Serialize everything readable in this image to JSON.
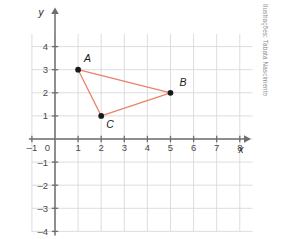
{
  "figure": {
    "credit": "Ilustrações: Tabata Nascimento",
    "axis_labels": {
      "x": "x",
      "y": "y"
    },
    "origin_label": "0"
  },
  "chart_data": {
    "type": "scatter",
    "title": "",
    "xlabel": "x",
    "ylabel": "y",
    "xlim": [
      -1.3,
      8.6
    ],
    "ylim": [
      -4.3,
      4.7
    ],
    "grid": true,
    "legend": "none",
    "xticks": [
      -1,
      0,
      1,
      2,
      3,
      4,
      5,
      6,
      7,
      8
    ],
    "xticklabels": [
      "–1",
      "0",
      "1",
      "2",
      "3",
      "4",
      "5",
      "6",
      "7",
      "8"
    ],
    "yticks": [
      -4,
      -3,
      -2,
      -1,
      1,
      2,
      3,
      4
    ],
    "yticklabels": [
      "–4",
      "–3",
      "–2",
      "–1",
      "1",
      "2",
      "3",
      "4"
    ],
    "points": [
      {
        "label": "A",
        "x": 1,
        "y": 3,
        "label_dx": 6,
        "label_dy": -8
      },
      {
        "label": "B",
        "x": 5,
        "y": 2,
        "label_dx": 9,
        "label_dy": -7
      },
      {
        "label": "C",
        "x": 2,
        "y": 1,
        "label_dx": 5,
        "label_dy": 12
      }
    ],
    "polygon": [
      "A",
      "B",
      "C"
    ],
    "colors": {
      "polygon_stroke": "#e8826a",
      "point_fill": "#1a1a1a",
      "grid": "#d9d9d9",
      "axis": "#6e6e6e",
      "tick_text": "#4a4a4a",
      "background": "#ffffff"
    }
  }
}
